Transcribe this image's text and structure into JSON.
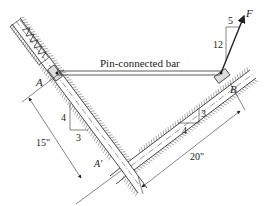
{
  "diagram": {
    "bar_label": "Pin-connected bar",
    "point_A": "A",
    "point_B": "B",
    "point_A_prime": "A'",
    "force_label": "F",
    "force_slope": {
      "rise": "12",
      "run": "5"
    },
    "left_slope": {
      "rise": "4",
      "run": "3"
    },
    "right_slope": {
      "rise": "3",
      "run": "4"
    },
    "dim_left": "15\"",
    "dim_right": "20\"",
    "colors": {
      "line": "#333333",
      "hatch": "#555555",
      "background": "#ffffff"
    }
  }
}
